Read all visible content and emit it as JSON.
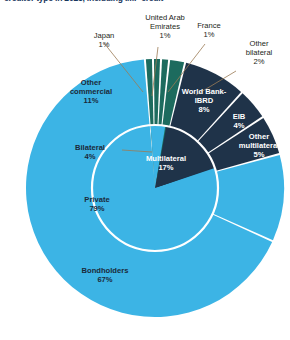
{
  "chart_data": {
    "type": "pie",
    "title": "creditor type in 2023, including IMF credit",
    "subtitle": "",
    "xlabel": "",
    "ylabel": "",
    "legend_position": "none",
    "grid": false,
    "note": "Two-level sunburst/donut: inner ring shows creditor group, outer ring shows component creditors.",
    "colors": {
      "light_blue": "#3cb4e5",
      "dark_navy": "#1f3349",
      "teal_green": "#1d6b5e",
      "separator": "#ffffff",
      "callout_line": "#9a7b55",
      "title_text": "#17365d"
    },
    "rings": [
      {
        "name": "inner",
        "slices": [
          {
            "label": "Private",
            "value": 79,
            "value_text": "79%",
            "color": "#3cb4e5"
          },
          {
            "label": "Multilateral",
            "value": 17,
            "value_text": "17%",
            "color": "#1f3349"
          },
          {
            "label": "Bilateral",
            "value": 4,
            "value_text": "4%",
            "color": "#3cb4e5"
          }
        ]
      },
      {
        "name": "outer",
        "slices": [
          {
            "label": "Bondholders",
            "value": 67,
            "value_text": "67%",
            "color": "#3cb4e5"
          },
          {
            "label": "Other commercial",
            "value": 11,
            "value_text": "11%",
            "color": "#3cb4e5"
          },
          {
            "label": "Japan",
            "value": 1,
            "value_text": "1%",
            "color": "#1d6b5e"
          },
          {
            "label": "United Arab Emirates",
            "value": 1,
            "value_text": "1%",
            "color": "#1d6b5e"
          },
          {
            "label": "France",
            "value": 1,
            "value_text": "1%",
            "color": "#1d6b5e"
          },
          {
            "label": "Other bilateral",
            "value": 2,
            "value_text": "2%",
            "color": "#1d6b5e"
          },
          {
            "label": "World Bank-IBRD",
            "value": 8,
            "value_text": "8%",
            "color": "#1f3349"
          },
          {
            "label": "EIB",
            "value": 4,
            "value_text": "4%",
            "color": "#1f3349"
          },
          {
            "label": "Other multilateral",
            "value": 5,
            "value_text": "5%",
            "color": "#1f3349"
          }
        ]
      }
    ],
    "categories": [
      "Bondholders",
      "Other commercial",
      "Japan",
      "United Arab Emirates",
      "France",
      "Other bilateral",
      "World Bank-IBRD",
      "EIB",
      "Other multilateral"
    ],
    "values": [
      67,
      11,
      1,
      1,
      1,
      2,
      8,
      4,
      5
    ]
  },
  "labels": {
    "japan": {
      "name": "Japan",
      "value": "1%"
    },
    "uae": {
      "name_line1": "United Arab",
      "name_line2": "Emirates",
      "value": "1%"
    },
    "france": {
      "name": "France",
      "value": "1%"
    },
    "other_bilateral": {
      "name_line1": "Other",
      "name_line2": "bilateral",
      "value": "2%"
    },
    "other_commercial": {
      "name_line1": "Other",
      "name_line2": "commercial",
      "value": "11%"
    },
    "bilateral": {
      "name": "Bilateral",
      "value": "4%"
    },
    "private": {
      "name": "Private",
      "value": "79%"
    },
    "bondholders": {
      "name": "Bondholders",
      "value": "67%"
    },
    "multilateral": {
      "name": "Multilateral",
      "value": "17%"
    },
    "world_bank": {
      "name_line1": "World Bank-",
      "name_line2": "IBRD",
      "value": "8%"
    },
    "eib": {
      "name": "EIB",
      "value": "4%"
    },
    "other_multilateral": {
      "name_line1": "Other",
      "name_line2": "multilateral",
      "value": "5%"
    }
  }
}
